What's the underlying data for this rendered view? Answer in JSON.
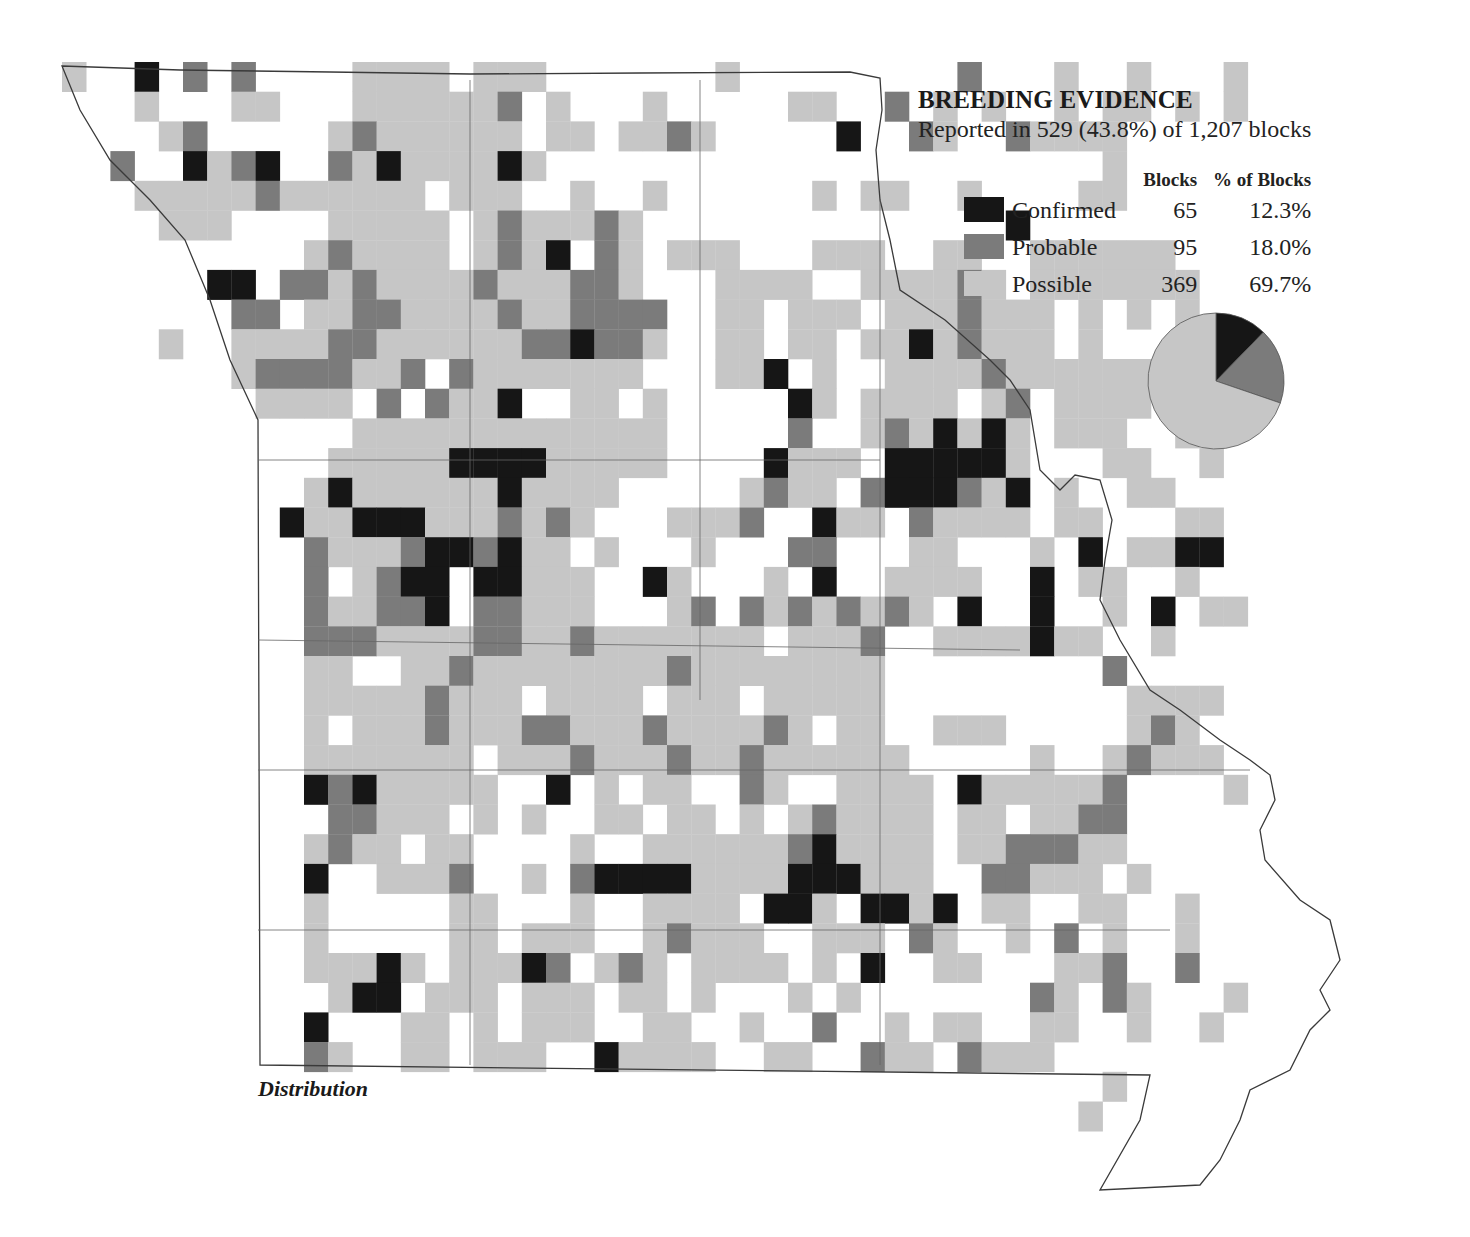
{
  "legend": {
    "title": "BREEDING EVIDENCE",
    "subtitle": "Reported in 529 (43.8%) of 1,207 blocks",
    "col_blocks": "Blocks",
    "col_pct": "% of Blocks",
    "categories": [
      {
        "label": "Confirmed",
        "blocks": "65",
        "pct": "12.3%",
        "color": "#161616"
      },
      {
        "label": "Probable",
        "blocks": "95",
        "pct": "18.0%",
        "color": "#7b7b7b"
      },
      {
        "label": "Possible",
        "blocks": "369",
        "pct": "69.7%",
        "color": "#c6c6c6"
      }
    ]
  },
  "caption": "Distribution",
  "chart_data": {
    "type": "pie",
    "title": "BREEDING EVIDENCE",
    "subtitle": "Reported in 529 (43.8%) of 1,207 blocks",
    "categories": [
      "Confirmed",
      "Probable",
      "Possible"
    ],
    "values": [
      65,
      95,
      369
    ],
    "percent": [
      12.3,
      18.0,
      69.7
    ],
    "colors": [
      "#161616",
      "#7b7b7b",
      "#c6c6c6"
    ],
    "total_blocks": 1207,
    "reported_blocks": 529
  },
  "map": {
    "grid": {
      "x0": 62,
      "y0": 62,
      "cw": 24.2,
      "ch": 29.7
    },
    "legend_codes": {
      "p": "Possible",
      "b": "Probable",
      "c": "Confirmed"
    },
    "rows": [
      "p..c.b.b....pppp.ppp.......p.........b...p..p...p.",
      "...p...pp...ppppppb.p...p.....pp..b.p.p..p.pp.p.p.",
      "....pb.....pbpppppp.pp.ppbp.....c..bp..bpppp......",
      "..b..cpbc..bpcppppcp.......................p......",
      "...pppppbpppppp.ppp..p..p......p.pp..p....pp......",
      "....ppp....ppppp.pbpppbp...............c..........",
      "..........pbpppp.pbpc.bp.ppp...ppp..pp..pppppp....",
      "......cc.bbpbppppbpppbbp...pppp..ppppbp.ppppppp...",
      ".......bb.ppbbppppbppbbbb..pp.ppp.pppbppp.p.p.p..",
      "....p..ppppbbppppppbbcbbp..pp.pp.ppcpbppp.p.......",
      ".......pbbbbppb.bppppppp...ppc.p..ppppbpppppp.....",
      "........pppp.b.bppc..pp.p.....cp.pppp.pb.pppp..b..",
      "............ppppppppppppp.....b..pbpcpcp.ppp..p...",
      "...........pppppccccppppp....cppp.cccccp...pp..p..",
      "..........pcppppppcpppp.....pbpp.bcccbpc.p..pp....",
      ".........cppcccpppbpbp...pppb..cpp.bpppp.pp...pp.",
      "..........bpppbccbcpp.p...p...bb...pp...p.c.ppcc.",
      "..........b.pbcc.ccppp..cp...p.c..pppp..c.pp..p..",
      "..........bppbbc.bbppp...pb.bpbpbpbp.c..c..p.c.pp",
      "..........bbbppppbbppbppppppp.pppb..ppppcpp..p..",
      "..........pp..ppbppppppppbpppppppp.........b...",
      "..........pppppbppp.pppp.ppp.ppppp..........pppp",
      "..........p.pppbpppbbpppbppppbp.pp..ppp.....pbp.",
      "..........ppppppp.pppbpppbppbpppppp.....p..pbppp",
      "..........cbcppppp..c.p.pp..bp..pppp.cpppppb....p",
      "...........bbppp.p.p..pp.pp.p.pbpppp.pp.ppbb....",
      "..........pbpp.pp....p..ppppppbcpppp.ppbbbpp....",
      "..........c..pppb..p.bccccppppcccppp..bbppp.p...",
      "..........p.....pp...p..pppp.ccp.ccpc.pp..pp..p.",
      "..........p.....pp.ppp..pbppp..ppp.bp..p.b.p..p..",
      "..........pppcp.pppcb.pbp.pppp.p.c..pp...ppb..b",
      "...........pcc.ppp.ppp.pp.p...p.p.......bp.bp...p",
      "..........c...pp.p.ppp..pp..p..b..p.pp..pp..p..p",
      "..........bp..pp.ppp..cpppp..pp..bpp.bppp......",
      "...........................................p....",
      "..........................................p....."
    ]
  }
}
